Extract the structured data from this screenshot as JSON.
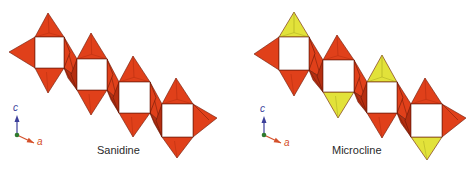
{
  "colors": {
    "background": "#ffffff",
    "sanidine_tetra": "#e0401a",
    "sanidine_tetra_dark": "#b52e10",
    "yellow_tetra": "#e2e23a",
    "yellow_tetra_dark": "#a9a820",
    "edge": "#6a1a08",
    "axis_c": "#3c3f9a",
    "axis_a": "#d4502a",
    "axis_origin": "#2f7a2f"
  },
  "panels": [
    {
      "id": "sanidine",
      "label": "Sanidine",
      "label_pos": [
        97,
        144
      ],
      "axes": {
        "origin": [
          17,
          135
        ],
        "c_tip": [
          17,
          115
        ],
        "a_tip": [
          34,
          143
        ],
        "c_label": "c",
        "a_label": "a",
        "c_label_pos": [
          13,
          102
        ],
        "a_label_pos": [
          37,
          136
        ]
      },
      "units": [
        {
          "square": [
            35,
            37,
            29,
            31
          ],
          "top": [
            48,
            13
          ],
          "bottom": [
            48,
            93
          ],
          "left": [
            9,
            52
          ],
          "right": null,
          "top_color": "red",
          "bottom_color": "red"
        },
        {
          "square": [
            77,
            59,
            30,
            31
          ],
          "top": [
            91,
            33
          ],
          "bottom": [
            91,
            115
          ],
          "left": null,
          "right": null,
          "top_color": "red",
          "bottom_color": "red"
        },
        {
          "square": [
            119,
            82,
            31,
            31
          ],
          "top": [
            133,
            56
          ],
          "bottom": [
            133,
            137
          ],
          "left": null,
          "right": null,
          "top_color": "red",
          "bottom_color": "red"
        },
        {
          "square": [
            162,
            104,
            31,
            33
          ],
          "top": [
            176,
            78
          ],
          "bottom": [
            177,
            158
          ],
          "left": null,
          "right": [
            217,
            118
          ],
          "top_color": "red",
          "bottom_color": "red"
        }
      ]
    },
    {
      "id": "microcline",
      "label": "Microcline",
      "label_pos": [
        332,
        144
      ],
      "axes": {
        "origin": [
          264,
          135
        ],
        "c_tip": [
          264,
          116
        ],
        "a_tip": [
          281,
          143
        ],
        "c_label": "c",
        "a_label": "a",
        "c_label_pos": [
          260,
          103
        ],
        "a_label_pos": [
          284,
          137
        ]
      },
      "units": [
        {
          "square": [
            279,
            37,
            30,
            33
          ],
          "top": [
            294,
            12
          ],
          "bottom": [
            294,
            96
          ],
          "left": [
            254,
            54
          ],
          "right": null,
          "top_color": "yellow",
          "bottom_color": "red"
        },
        {
          "square": [
            323,
            60,
            31,
            32
          ],
          "top": [
            337,
            35
          ],
          "bottom": [
            338,
            118
          ],
          "left": null,
          "right": null,
          "top_color": "red",
          "bottom_color": "yellow"
        },
        {
          "square": [
            367,
            82,
            30,
            31
          ],
          "top": [
            382,
            55
          ],
          "bottom": [
            382,
            138
          ],
          "left": null,
          "right": null,
          "top_color": "yellow",
          "bottom_color": "red"
        },
        {
          "square": [
            411,
            104,
            31,
            33
          ],
          "top": [
            425,
            78
          ],
          "bottom": [
            427,
            160
          ],
          "left": null,
          "right": [
            466,
            118
          ],
          "top_color": "red",
          "bottom_color": "yellow"
        }
      ]
    }
  ]
}
